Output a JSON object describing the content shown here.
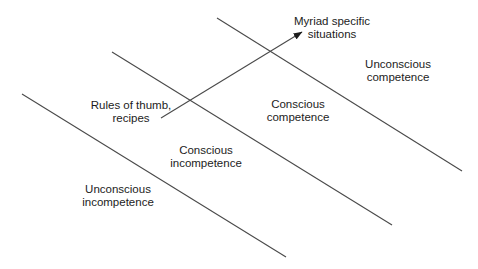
{
  "diagram_type": "stages-of-competence-learning-diagram",
  "labels": {
    "myriad": {
      "line1": "Myriad specific",
      "line2": "situations"
    },
    "unconscious_competence": {
      "line1": "Unconscious",
      "line2": "competence"
    },
    "conscious_competence": {
      "line1": "Conscious",
      "line2": "competence"
    },
    "rules_of_thumb": {
      "line1": "Rules of thumb,",
      "line2": "recipes"
    },
    "conscious_incompetence": {
      "line1": "Conscious",
      "line2": "incompetence"
    },
    "unconscious_incompetence": {
      "line1": "Unconscious",
      "line2": "incompetence"
    }
  },
  "colors": {
    "background": "#ffffff",
    "line": "#4a4a4a",
    "text": "#1c1c1c",
    "arrowhead": "#1c1c1c"
  }
}
